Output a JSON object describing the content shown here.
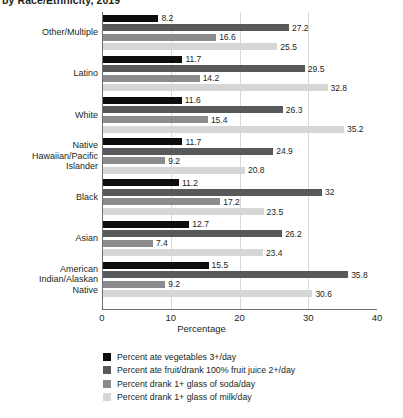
{
  "title_clipped": "by Race/Ethnicity, 2019",
  "axis": {
    "xlabel": "Percentage",
    "xticks": [
      "0",
      "10",
      "20",
      "30",
      "40"
    ],
    "xmin": 0,
    "xmax": 40
  },
  "colors": {
    "series1": "#0d0d0d",
    "series2": "#58595b",
    "series3": "#8c8c8e",
    "series4": "#d5d6d6",
    "gridline": "#d9d9d9",
    "axis": "#6d6e71",
    "text": "#231f20",
    "background": "#ffffff"
  },
  "legend": [
    {
      "label": "Percent ate vegetables 3+/day",
      "color": "#0d0d0d",
      "swatch": "series1-swatch"
    },
    {
      "label": "Percent ate fruit/drank 100% fruit juice 2+/day",
      "color": "#58595b",
      "swatch": "series2-swatch"
    },
    {
      "label": "Percent drank 1+ glass of soda/day",
      "color": "#8c8c8e",
      "swatch": "series3-swatch"
    },
    {
      "label": "Percent drank 1+ glass of milk/day",
      "color": "#d5d6d6",
      "swatch": "series4-swatch"
    }
  ],
  "chart_data": {
    "type": "bar",
    "orientation": "horizontal",
    "title": "by Race/Ethnicity, 2019",
    "xlabel": "Percentage",
    "ylabel": "",
    "xlim": [
      0,
      40
    ],
    "grid": true,
    "legend_position": "bottom-left",
    "categories": [
      "Other/Multiple",
      "Latino",
      "White",
      "Native Hawaiian/Pacific Islander",
      "Black",
      "Asian",
      "American Indian/Alaskan Native"
    ],
    "category_lines": [
      [
        "Other/Multiple"
      ],
      [
        "Latino"
      ],
      [
        "White"
      ],
      [
        "Native",
        "Hawaiian/Pacific",
        "Islander"
      ],
      [
        "Black"
      ],
      [
        "Asian"
      ],
      [
        "American",
        "Indian/Alaskan",
        "Native"
      ]
    ],
    "series": [
      {
        "name": "Percent ate vegetables 3+/day",
        "color": "#0d0d0d",
        "values": [
          8.2,
          11.7,
          11.6,
          11.7,
          11.2,
          12.7,
          15.5
        ],
        "labels": [
          "8.2",
          "11.7",
          "11.6",
          "11.7",
          "11.2",
          "12.7",
          "15.5"
        ]
      },
      {
        "name": "Percent ate fruit/drank 100% fruit juice 2+/day",
        "color": "#58595b",
        "values": [
          27.2,
          29.5,
          26.3,
          24.9,
          32.0,
          26.2,
          35.8
        ],
        "labels": [
          "27.2",
          "29.5",
          "26.3",
          "24.9",
          "32",
          "26.2",
          "35.8"
        ]
      },
      {
        "name": "Percent drank 1+ glass of soda/day",
        "color": "#8c8c8e",
        "values": [
          16.6,
          14.2,
          15.4,
          9.2,
          17.2,
          7.4,
          9.2
        ],
        "labels": [
          "16.6",
          "14.2",
          "15.4",
          "9.2",
          "17.2",
          "7.4",
          "9.2"
        ]
      },
      {
        "name": "Percent drank 1+ glass of milk/day",
        "color": "#d5d6d6",
        "values": [
          25.5,
          32.8,
          35.2,
          20.8,
          23.5,
          23.4,
          30.6
        ],
        "labels": [
          "25.5",
          "32.8",
          "35.2",
          "20.8",
          "23.5",
          "23.4",
          "30.6"
        ]
      }
    ]
  }
}
